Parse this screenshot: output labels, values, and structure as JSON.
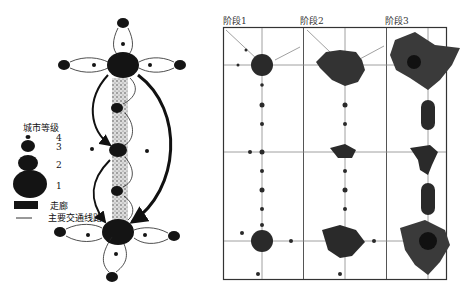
{
  "left_diagram": {
    "legend": {
      "title": "城市等级",
      "levels": [
        {
          "label": "4"
        },
        {
          "label": "3"
        },
        {
          "label": "2"
        },
        {
          "label": "1"
        }
      ],
      "corridor_label": "走廊",
      "road_label": "主要交通线路"
    }
  },
  "right_diagram": {
    "stages": [
      {
        "label": "阶段1"
      },
      {
        "label": "阶段2"
      },
      {
        "label": "阶段3"
      }
    ]
  },
  "colors": {
    "ink": "#1a1a1a",
    "frame": "#333333",
    "line": "#777777"
  }
}
